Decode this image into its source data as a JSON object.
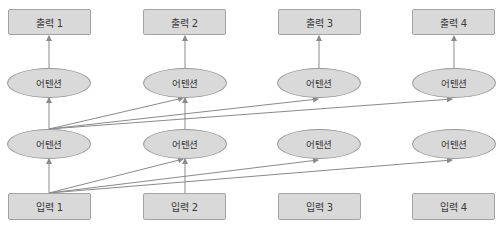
{
  "colors": {
    "node_fill": "#d9d9d9",
    "node_border": "#9a9a9a",
    "edge": "#8a8a8a",
    "text": "#3a3a3a"
  },
  "outputs": [
    {
      "label": "출력 1"
    },
    {
      "label": "출력 2"
    },
    {
      "label": "출력 3"
    },
    {
      "label": "출력 4"
    }
  ],
  "attention_upper": [
    {
      "label": "어텐션"
    },
    {
      "label": "어텐션"
    },
    {
      "label": "어텐션"
    },
    {
      "label": "어텐션"
    }
  ],
  "attention_lower": [
    {
      "label": "어텐션"
    },
    {
      "label": "어텐션"
    },
    {
      "label": "어텐션"
    },
    {
      "label": "어텐션"
    }
  ],
  "inputs": [
    {
      "label": "입력 1"
    },
    {
      "label": "입력 2"
    },
    {
      "label": "입력 3"
    },
    {
      "label": "입력 4"
    }
  ],
  "edges": [
    {
      "from": "input-1",
      "to": "attention-lower-1"
    },
    {
      "from": "input-1",
      "to": "attention-lower-2"
    },
    {
      "from": "input-1",
      "to": "attention-lower-3"
    },
    {
      "from": "input-1",
      "to": "attention-lower-4"
    },
    {
      "from": "input-2",
      "to": "attention-lower-2"
    },
    {
      "from": "attention-lower-1",
      "to": "attention-upper-1"
    },
    {
      "from": "attention-lower-1",
      "to": "attention-upper-2"
    },
    {
      "from": "attention-lower-1",
      "to": "attention-upper-3"
    },
    {
      "from": "attention-lower-1",
      "to": "attention-upper-4"
    },
    {
      "from": "attention-lower-2",
      "to": "attention-upper-2"
    },
    {
      "from": "attention-upper-1",
      "to": "output-1"
    },
    {
      "from": "attention-upper-2",
      "to": "output-2"
    },
    {
      "from": "attention-upper-3",
      "to": "output-3"
    },
    {
      "from": "attention-upper-4",
      "to": "output-4"
    }
  ]
}
